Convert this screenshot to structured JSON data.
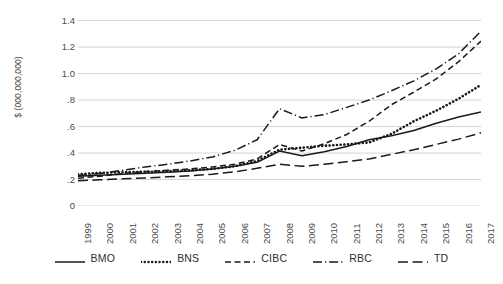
{
  "chart_data": {
    "type": "line",
    "title": "",
    "xlabel": "",
    "ylabel": "$ (000,000,000)",
    "x": [
      1999,
      2000,
      2001,
      2002,
      2003,
      2004,
      2005,
      2006,
      2007,
      2008,
      2009,
      2010,
      2011,
      2012,
      2013,
      2014,
      2015,
      2016,
      2017
    ],
    "xtick_labels": [
      "1999",
      "2000",
      "2001",
      "2002",
      "2003",
      "2004",
      "2005",
      "2006",
      "2007",
      "2008",
      "2009",
      "2010",
      "2011",
      "2012",
      "2013",
      "2014",
      "2015",
      "2016",
      "2017"
    ],
    "ytick_labels": [
      "1.4",
      "1.2",
      "1.0",
      ".8",
      ".6",
      ".4",
      ".2",
      "0"
    ],
    "ytick_values": [
      1.4,
      1.2,
      1.0,
      0.8,
      0.6,
      0.4,
      0.2,
      0
    ],
    "ylim": [
      0,
      1.45
    ],
    "xlim": [
      1999,
      2017
    ],
    "grid": "horizontal",
    "legend_position": "bottom",
    "series": [
      {
        "name": "BMO",
        "dash": "solid",
        "color": "#1a1a1a",
        "values": [
          0.225,
          0.233,
          0.24,
          0.248,
          0.255,
          0.265,
          0.28,
          0.3,
          0.33,
          0.415,
          0.38,
          0.41,
          0.45,
          0.5,
          0.53,
          0.57,
          0.625,
          0.672,
          0.71
        ]
      },
      {
        "name": "BNS",
        "dash": "dotted",
        "color": "#1a1a1a",
        "values": [
          0.24,
          0.25,
          0.255,
          0.258,
          0.262,
          0.27,
          0.28,
          0.3,
          0.34,
          0.425,
          0.44,
          0.455,
          0.465,
          0.48,
          0.545,
          0.64,
          0.72,
          0.81,
          0.915
        ]
      },
      {
        "name": "CIBC",
        "dash": "dashed",
        "color": "#1a1a1a",
        "values": [
          0.21,
          0.225,
          0.245,
          0.26,
          0.27,
          0.28,
          0.295,
          0.315,
          0.355,
          0.465,
          0.415,
          0.47,
          0.54,
          0.64,
          0.765,
          0.86,
          0.96,
          1.09,
          1.245
        ]
      },
      {
        "name": "RBC",
        "dash": "dashdot",
        "color": "#1a1a1a",
        "values": [
          0.23,
          0.245,
          0.27,
          0.295,
          0.315,
          0.34,
          0.37,
          0.42,
          0.5,
          0.735,
          0.665,
          0.69,
          0.745,
          0.8,
          0.87,
          0.945,
          1.035,
          1.15,
          1.32
        ]
      },
      {
        "name": "TD",
        "dash": "longdash",
        "color": "#1a1a1a",
        "values": [
          0.19,
          0.198,
          0.205,
          0.212,
          0.22,
          0.228,
          0.24,
          0.258,
          0.285,
          0.315,
          0.3,
          0.315,
          0.335,
          0.355,
          0.39,
          0.425,
          0.465,
          0.505,
          0.553
        ]
      }
    ]
  },
  "legend": {
    "items": [
      {
        "label": "BMO",
        "icon": "solid-line-icon"
      },
      {
        "label": "BNS",
        "icon": "dotted-line-icon"
      },
      {
        "label": "CIBC",
        "icon": "dashed-line-icon"
      },
      {
        "label": "RBC",
        "icon": "dash-dot-line-icon"
      },
      {
        "label": "TD",
        "icon": "long-dash-line-icon"
      }
    ]
  },
  "axes": {
    "y_title": "$ (000,000,000)"
  }
}
